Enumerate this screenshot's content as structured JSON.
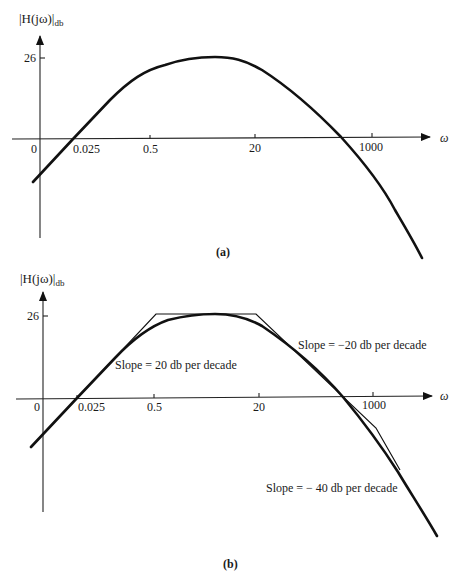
{
  "figure_a": {
    "y_label": "|H(jω)|",
    "y_label_sub": "db",
    "y_tick_label": "26",
    "x_axis_label": "ω",
    "x_ticks": [
      "0",
      "0.025",
      "0.5",
      "20",
      "1000"
    ],
    "caption": "(a)"
  },
  "figure_b": {
    "y_label": "|H(jω)|",
    "y_label_sub": "db",
    "y_tick_label": "26",
    "x_axis_label": "ω",
    "x_ticks": [
      "0",
      "0.025",
      "0.5",
      "20",
      "1000"
    ],
    "caption": "(b)",
    "annotations": {
      "slope_rise": "Slope = 20 db per decade",
      "slope_fall_20": "Slope = −20 db per decade",
      "slope_fall_40": "Slope = − 40 db per decade"
    }
  },
  "colors": {
    "ink": "#111111",
    "background": "#ffffff"
  }
}
